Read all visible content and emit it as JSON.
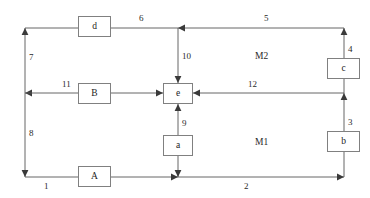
{
  "diagram": {
    "type": "block-flow-diagram",
    "background_color": "#ffffff",
    "line_color": "#555555",
    "box_border_color": "#808080",
    "text_color": "#2a2a2a",
    "nodes": [
      {
        "id": "d",
        "label": "d",
        "x": 78,
        "y": 16,
        "w": 33,
        "h": 21
      },
      {
        "id": "B",
        "label": "B",
        "x": 78,
        "y": 83,
        "w": 33,
        "h": 21
      },
      {
        "id": "A",
        "label": "A",
        "x": 78,
        "y": 166,
        "w": 33,
        "h": 21
      },
      {
        "id": "e",
        "label": "e",
        "x": 163,
        "y": 83,
        "w": 30,
        "h": 21
      },
      {
        "id": "a",
        "label": "a",
        "x": 163,
        "y": 135,
        "w": 30,
        "h": 21
      },
      {
        "id": "c",
        "label": "c",
        "x": 327,
        "y": 58,
        "w": 33,
        "h": 21
      },
      {
        "id": "b",
        "label": "b",
        "x": 327,
        "y": 131,
        "w": 33,
        "h": 21
      }
    ],
    "edge_labels": [
      {
        "id": "l1",
        "text": "1",
        "x": 44,
        "y": 182
      },
      {
        "id": "l2",
        "text": "2",
        "x": 244,
        "y": 182
      },
      {
        "id": "l3",
        "text": "3",
        "x": 348,
        "y": 118
      },
      {
        "id": "l4",
        "text": "4",
        "x": 348,
        "y": 45
      },
      {
        "id": "l5",
        "text": "5",
        "x": 264,
        "y": 14
      },
      {
        "id": "l6",
        "text": "6",
        "x": 139,
        "y": 14
      },
      {
        "id": "l7",
        "text": "7",
        "x": 29,
        "y": 53
      },
      {
        "id": "l8",
        "text": "8",
        "x": 29,
        "y": 129
      },
      {
        "id": "l9",
        "text": "9",
        "x": 182,
        "y": 119
      },
      {
        "id": "l10",
        "text": "10",
        "x": 182,
        "y": 52
      },
      {
        "id": "l11",
        "text": "11",
        "x": 62,
        "y": 80
      },
      {
        "id": "l12",
        "text": "12",
        "x": 248,
        "y": 80
      }
    ],
    "region_labels": [
      {
        "id": "m2",
        "text": "M2",
        "x": 255,
        "y": 52
      },
      {
        "id": "m1",
        "text": "M1",
        "x": 255,
        "y": 138
      }
    ],
    "geometry": {
      "left_rail_x": 25,
      "right_rail_x": 344,
      "center_rail_x": 178,
      "top_rail_y": 28,
      "middle_rail_y": 93,
      "bottom_rail_y": 177
    }
  }
}
